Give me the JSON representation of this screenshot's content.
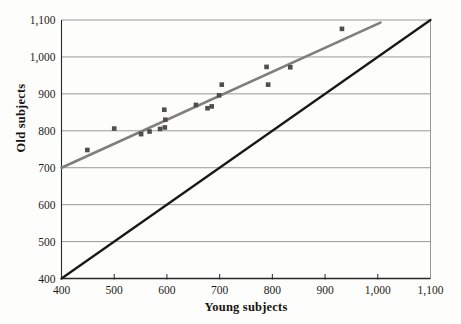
{
  "chart_data": {
    "type": "scatter",
    "title": "",
    "xlabel": "Young subjects",
    "ylabel": "Old subjects",
    "xlim": [
      400,
      1100
    ],
    "ylim": [
      400,
      1100
    ],
    "xticks": [
      400,
      500,
      600,
      700,
      800,
      900,
      1000,
      1100
    ],
    "yticks": [
      400,
      500,
      600,
      700,
      800,
      900,
      1000,
      1100
    ],
    "tick_format": "comma",
    "grid": "horizontal",
    "legend": "none",
    "points": [
      [
        449,
        748
      ],
      [
        500,
        806
      ],
      [
        551,
        791
      ],
      [
        567,
        798
      ],
      [
        587,
        805
      ],
      [
        596,
        809
      ],
      [
        597,
        830
      ],
      [
        595,
        857
      ],
      [
        655,
        870
      ],
      [
        677,
        861
      ],
      [
        685,
        866
      ],
      [
        699,
        896
      ],
      [
        704,
        925
      ],
      [
        789,
        973
      ],
      [
        792,
        925
      ],
      [
        834,
        972
      ],
      [
        932,
        1076
      ]
    ],
    "lines": [
      {
        "name": "regression-line",
        "color": "#7e7e7e",
        "width": 2.6,
        "from": [
          400,
          700
        ],
        "to": [
          1005,
          1093
        ]
      },
      {
        "name": "identity-line",
        "color": "#191919",
        "width": 2.3,
        "from": [
          400,
          400
        ],
        "to": [
          1100,
          1100
        ]
      }
    ],
    "colors": {
      "point": "#514d4c",
      "gridline": "#8f8f8f",
      "axis": "#2a2826",
      "background": "#fdfdfb"
    },
    "point_size": 4.6
  },
  "layout": {
    "plot": {
      "left": 61.5,
      "top": 20,
      "right": 430.5,
      "bottom": 278.5
    }
  }
}
